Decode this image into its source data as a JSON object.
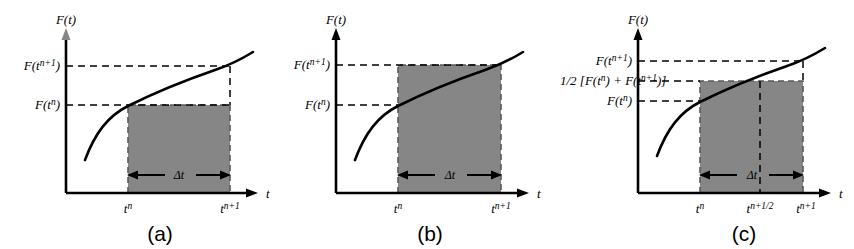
{
  "figure": {
    "type": "diagram",
    "fill_color": "#868686",
    "line_color": "#000000"
  },
  "panels": [
    {
      "id": "a",
      "caption": "(a)",
      "scheme": "explicit-euler",
      "y_axis_label": "F(t)",
      "x_axis_label": "t",
      "y_labels": [
        {
          "base": "F(t",
          "sup": "n+1",
          "close": ")"
        },
        {
          "base": "F(t",
          "sup": "n",
          "close": ")"
        }
      ],
      "x_ticks": [
        {
          "base": "t",
          "sup": "n"
        },
        {
          "base": "t",
          "sup": "n+1"
        }
      ],
      "span_label": "Δt",
      "rect_top_level": "F(t^n)"
    },
    {
      "id": "b",
      "caption": "(b)",
      "scheme": "implicit-euler",
      "y_axis_label": "F(t)",
      "x_axis_label": "t",
      "y_labels": [
        {
          "base": "F(t",
          "sup": "n+1",
          "close": ")"
        },
        {
          "base": "F(t",
          "sup": "n",
          "close": ")"
        }
      ],
      "x_ticks": [
        {
          "base": "t",
          "sup": "n"
        },
        {
          "base": "t",
          "sup": "n+1"
        }
      ],
      "span_label": "Δt",
      "rect_top_level": "F(t^n+1)"
    },
    {
      "id": "c",
      "caption": "(c)",
      "scheme": "crank-nicolson-midpoint",
      "y_axis_label": "F(t)",
      "x_axis_label": "t",
      "y_labels": [
        {
          "base": "F(t",
          "sup": "n+1",
          "close": ")"
        },
        {
          "prefix": "1/2 [F(t",
          "sup": "n",
          "mid": ") + F(t",
          "sup2": "n+1",
          "close": ")]"
        },
        {
          "base": "F(t",
          "sup": "n",
          "close": ")"
        }
      ],
      "x_ticks": [
        {
          "base": "t",
          "sup": "n"
        },
        {
          "base": "t",
          "sup": "n+1/2"
        },
        {
          "base": "t",
          "sup": "n+1"
        }
      ],
      "span_label": "Δt",
      "rect_top_level": "1/2[F(t^n)+F(t^n+1)]"
    }
  ]
}
